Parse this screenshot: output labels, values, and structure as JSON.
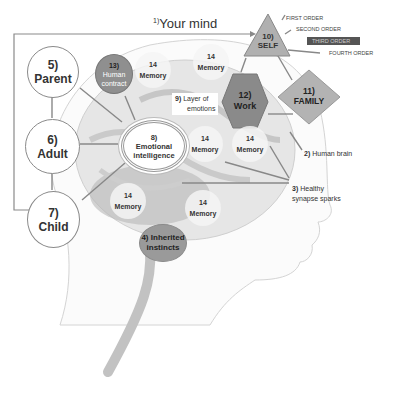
{
  "title": {
    "number": "1)",
    "text": "Your mind"
  },
  "ego_states": [
    {
      "number": "5)",
      "label": "Parent"
    },
    {
      "number": "6)",
      "label": "Adult"
    },
    {
      "number": "7)",
      "label": "Child"
    }
  ],
  "human_contract": {
    "number": "13)",
    "line1": "Human",
    "line2": "contract"
  },
  "memory_label": {
    "number": "14",
    "label": "Memory"
  },
  "layer_of_emotions": {
    "number": "9)",
    "line1": "Layer of",
    "line2": "emotions"
  },
  "emotional_intelligence": {
    "number": "8)",
    "line1": "Emotional",
    "line2": "intelligence"
  },
  "self": {
    "number": "10)",
    "label": "SELF"
  },
  "work": {
    "number": "12)",
    "label": "Work"
  },
  "family": {
    "number": "11)",
    "label": "FAMILY"
  },
  "orders": [
    "FIRST ORDER",
    "SECOND ORDER",
    "THIRD ORDER",
    "FOURTH ORDER"
  ],
  "human_brain": {
    "number": "2)",
    "label": "Human brain"
  },
  "synapse": {
    "number": "3)",
    "line1": "Healthy",
    "line2": "synapse sparks"
  },
  "instincts": {
    "number": "4)",
    "line1": "Inherited",
    "line2": "instincts"
  },
  "colors": {
    "human_contract": "#8f8f8f",
    "work": "#8a8a8a",
    "self": "#a9a9a9",
    "family": "#b0b0b0",
    "third_order_bg": "#555555",
    "instincts": "#9a9a9a",
    "line": "#7a7a7a"
  }
}
